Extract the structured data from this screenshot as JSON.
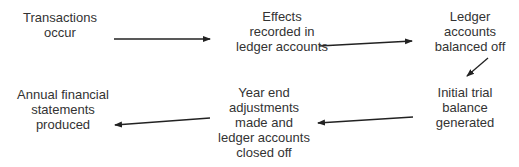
{
  "diagram": {
    "type": "process-flow",
    "nodes": [
      {
        "id": "n1",
        "lines": [
          "Transactions",
          "occur"
        ]
      },
      {
        "id": "n2",
        "lines": [
          "Effects",
          "recorded in",
          "ledger accounts"
        ]
      },
      {
        "id": "n3",
        "lines": [
          "Ledger",
          "accounts",
          "balanced off"
        ]
      },
      {
        "id": "n4",
        "lines": [
          "Initial trial",
          "balance",
          "generated"
        ]
      },
      {
        "id": "n5",
        "lines": [
          "Year end",
          "adjustments",
          "made and",
          "ledger accounts",
          "closed off"
        ]
      },
      {
        "id": "n6",
        "lines": [
          "Annual financial",
          "statements",
          "produced"
        ]
      }
    ],
    "edges": [
      {
        "from": "n1",
        "to": "n2"
      },
      {
        "from": "n2",
        "to": "n3"
      },
      {
        "from": "n3",
        "to": "n4"
      },
      {
        "from": "n4",
        "to": "n5"
      },
      {
        "from": "n5",
        "to": "n6"
      }
    ],
    "colors": {
      "text": "#333333",
      "arrow": "#222222",
      "background": "#ffffff"
    }
  }
}
